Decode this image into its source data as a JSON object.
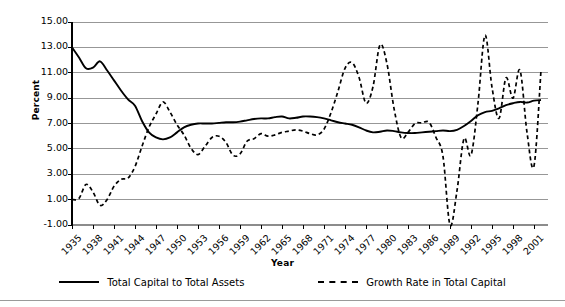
{
  "chart_data": {
    "type": "line",
    "title": "",
    "xlabel": "Year",
    "ylabel": "Percent",
    "ylim": [
      -1.0,
      15.0
    ],
    "ytick_step": 2.0,
    "ytick_labels": [
      "15.00",
      "13.00",
      "11.00",
      "9.00",
      "7.00",
      "5.00",
      "3.00",
      "1.00",
      "-1.00"
    ],
    "ytick_values": [
      15.0,
      13.0,
      11.0,
      9.0,
      7.0,
      5.0,
      3.0,
      1.0,
      -1.0
    ],
    "xlim": [
      1935,
      2003
    ],
    "xtick_labels": [
      "1935",
      "1938",
      "1941",
      "1944",
      "1947",
      "1950",
      "1953",
      "1956",
      "1959",
      "1962",
      "1965",
      "1968",
      "1971",
      "1974",
      "1977",
      "1980",
      "1983",
      "1986",
      "1989",
      "1992",
      "1995",
      "1998",
      "2001"
    ],
    "xtick_values": [
      1935,
      1938,
      1941,
      1944,
      1947,
      1950,
      1953,
      1956,
      1959,
      1962,
      1965,
      1968,
      1971,
      1974,
      1977,
      1980,
      1983,
      1986,
      1989,
      1992,
      1995,
      1998,
      2001
    ],
    "grid": "horizontal",
    "legend_position": "bottom",
    "x": [
      1935,
      1936,
      1937,
      1938,
      1939,
      1940,
      1941,
      1942,
      1943,
      1944,
      1945,
      1946,
      1947,
      1948,
      1949,
      1950,
      1951,
      1952,
      1953,
      1954,
      1955,
      1956,
      1957,
      1958,
      1959,
      1960,
      1961,
      1962,
      1963,
      1964,
      1965,
      1966,
      1967,
      1968,
      1969,
      1970,
      1971,
      1972,
      1973,
      1974,
      1975,
      1976,
      1977,
      1978,
      1979,
      1980,
      1981,
      1982,
      1983,
      1984,
      1985,
      1986,
      1987,
      1988,
      1989,
      1990,
      1991,
      1992,
      1993,
      1994,
      1995,
      1996,
      1997,
      1998,
      1999,
      2000,
      2001,
      2002
    ],
    "series": [
      {
        "name": "Total Capital to Total Assets",
        "style": "solid",
        "color": "#000000",
        "values": [
          13.0,
          12.2,
          11.35,
          11.4,
          11.9,
          11.2,
          10.4,
          9.6,
          8.9,
          8.4,
          7.2,
          6.3,
          5.9,
          5.75,
          5.9,
          6.3,
          6.7,
          6.9,
          7.0,
          7.0,
          7.0,
          7.05,
          7.1,
          7.1,
          7.15,
          7.25,
          7.35,
          7.4,
          7.4,
          7.5,
          7.55,
          7.4,
          7.45,
          7.55,
          7.55,
          7.5,
          7.4,
          7.25,
          7.1,
          7.0,
          6.9,
          6.7,
          6.45,
          6.3,
          6.35,
          6.45,
          6.4,
          6.3,
          6.25,
          6.25,
          6.3,
          6.35,
          6.4,
          6.45,
          6.4,
          6.5,
          6.8,
          7.2,
          7.65,
          7.9,
          8.0,
          8.2,
          8.45,
          8.6,
          8.7,
          8.65,
          8.8,
          8.85
        ]
      },
      {
        "name": "Growth Rate in Total Capital",
        "style": "dashed",
        "color": "#000000",
        "values": [
          1.0,
          1.1,
          2.2,
          1.6,
          0.55,
          1.0,
          2.05,
          2.6,
          2.7,
          3.6,
          5.2,
          6.7,
          7.75,
          8.7,
          7.9,
          6.9,
          6.1,
          5.05,
          4.55,
          5.2,
          5.9,
          6.0,
          5.5,
          4.5,
          4.6,
          5.6,
          5.8,
          6.2,
          6.0,
          6.1,
          6.3,
          6.4,
          6.5,
          6.4,
          6.2,
          6.1,
          6.55,
          7.85,
          9.55,
          11.35,
          11.8,
          10.65,
          8.6,
          9.9,
          13.2,
          11.7,
          8.2,
          5.9,
          6.3,
          7.0,
          7.05,
          7.1,
          5.9,
          4.4,
          -1.0,
          1.7,
          5.8,
          4.5,
          8.6,
          13.95,
          9.85,
          7.4,
          10.6,
          9.0,
          11.2,
          6.3,
          3.65,
          11.2
        ]
      }
    ]
  },
  "legend": {
    "items": [
      {
        "label": "Total Capital to Total Assets",
        "style": "solid"
      },
      {
        "label": "Growth Rate in Total Capital",
        "style": "dashed"
      }
    ]
  },
  "colors": {
    "gridline": "#8c8c8c",
    "axis": "#000000",
    "background": "#ffffff",
    "footer_rule": "#9a9a9a"
  }
}
